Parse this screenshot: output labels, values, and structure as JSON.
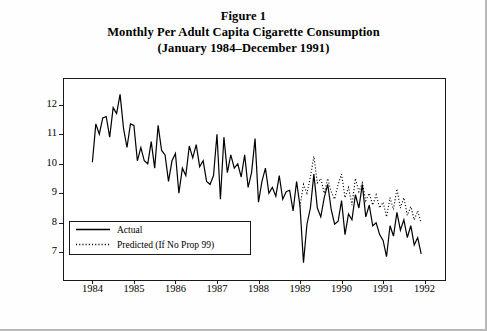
{
  "figure": {
    "title_lines": [
      "Figure 1",
      "Monthly Per Adult Capita Cigarette Consumption",
      "(January 1984–December 1991)"
    ]
  },
  "chart_data": {
    "type": "line",
    "title": "Monthly Per Adult Capita Cigarette Consumption (January 1984–December 1991)",
    "xlabel": "",
    "ylabel": "Number of Packs",
    "xlim": [
      1983.75,
      1992.25
    ],
    "ylim": [
      6.4,
      12.6
    ],
    "yticks": [
      7,
      8,
      9,
      10,
      11,
      12
    ],
    "xticks": [
      1984,
      1985,
      1986,
      1987,
      1988,
      1989,
      1990,
      1991,
      1992
    ],
    "grid": false,
    "legend_position": "bottom-left",
    "series": [
      {
        "name": "Actual",
        "style": "solid",
        "color": "#000000",
        "x": [
          1984.0,
          1984.083,
          1984.167,
          1984.25,
          1984.333,
          1984.417,
          1984.5,
          1984.583,
          1984.667,
          1984.75,
          1984.833,
          1984.917,
          1985.0,
          1985.083,
          1985.167,
          1985.25,
          1985.333,
          1985.417,
          1985.5,
          1985.583,
          1985.667,
          1985.75,
          1985.833,
          1985.917,
          1986.0,
          1986.083,
          1986.167,
          1986.25,
          1986.333,
          1986.417,
          1986.5,
          1986.583,
          1986.667,
          1986.75,
          1986.833,
          1986.917,
          1987.0,
          1987.083,
          1987.167,
          1987.25,
          1987.333,
          1987.417,
          1987.5,
          1987.583,
          1987.667,
          1987.75,
          1987.833,
          1987.917,
          1988.0,
          1988.083,
          1988.167,
          1988.25,
          1988.333,
          1988.417,
          1988.5,
          1988.583,
          1988.667,
          1988.75,
          1988.833,
          1988.917,
          1989.0,
          1989.083,
          1989.167,
          1989.25,
          1989.333,
          1989.417,
          1989.5,
          1989.583,
          1989.667,
          1989.75,
          1989.833,
          1989.917,
          1990.0,
          1990.083,
          1990.167,
          1990.25,
          1990.333,
          1990.417,
          1990.5,
          1990.583,
          1990.667,
          1990.75,
          1990.833,
          1990.917,
          1991.0,
          1991.083,
          1991.167,
          1991.25,
          1991.333,
          1991.417,
          1991.5,
          1991.583,
          1991.667,
          1991.75,
          1991.833,
          1991.917
        ],
        "y": [
          10.05,
          11.35,
          11.0,
          11.55,
          11.6,
          10.9,
          11.9,
          11.7,
          12.35,
          11.2,
          10.55,
          11.35,
          11.3,
          10.1,
          10.55,
          10.1,
          10.0,
          10.75,
          9.85,
          11.3,
          10.45,
          10.3,
          9.4,
          10.1,
          10.35,
          9.0,
          9.85,
          9.6,
          10.6,
          10.2,
          10.65,
          9.9,
          10.1,
          9.4,
          9.3,
          9.6,
          11.0,
          8.8,
          10.9,
          9.7,
          10.3,
          9.85,
          10.0,
          9.55,
          10.3,
          9.2,
          9.7,
          10.85,
          8.7,
          9.4,
          9.85,
          9.0,
          9.2,
          8.9,
          9.6,
          8.8,
          9.05,
          9.1,
          8.4,
          9.4,
          8.55,
          6.65,
          7.95,
          8.5,
          9.65,
          8.5,
          8.2,
          8.85,
          9.3,
          8.45,
          7.95,
          8.05,
          8.75,
          7.6,
          8.3,
          8.1,
          8.95,
          8.5,
          9.3,
          8.2,
          8.6,
          7.9,
          8.0,
          7.6,
          7.4,
          6.85,
          7.9,
          7.55,
          8.35,
          7.75,
          8.1,
          7.5,
          7.9,
          7.25,
          7.5,
          6.95
        ]
      },
      {
        "name": "Predicted (If No Prop 99)",
        "style": "dotted",
        "color": "#000000",
        "x": [
          1989.0,
          1989.083,
          1989.167,
          1989.25,
          1989.333,
          1989.417,
          1989.5,
          1989.583,
          1989.667,
          1989.75,
          1989.833,
          1989.917,
          1990.0,
          1990.083,
          1990.167,
          1990.25,
          1990.333,
          1990.417,
          1990.5,
          1990.583,
          1990.667,
          1990.75,
          1990.833,
          1990.917,
          1991.0,
          1991.083,
          1991.167,
          1991.25,
          1991.333,
          1991.417,
          1991.5,
          1991.583,
          1991.667,
          1991.75,
          1991.833,
          1991.917
        ],
        "y": [
          8.55,
          9.3,
          9.0,
          9.55,
          10.25,
          9.35,
          9.5,
          9.0,
          9.5,
          9.05,
          8.8,
          9.3,
          9.65,
          8.85,
          9.2,
          8.6,
          9.5,
          9.05,
          9.35,
          8.75,
          9.0,
          8.6,
          8.95,
          8.5,
          8.7,
          8.2,
          8.85,
          8.45,
          9.15,
          8.5,
          8.85,
          8.25,
          8.55,
          8.1,
          8.4,
          8.0
        ]
      }
    ],
    "legend": [
      {
        "label": "Actual",
        "style": "solid"
      },
      {
        "label": "Predicted (If No Prop 99)",
        "style": "dotted"
      }
    ]
  }
}
